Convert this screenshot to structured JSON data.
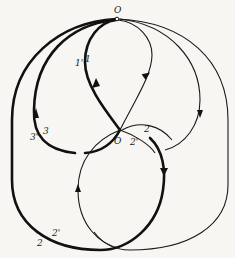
{
  "diagram": {
    "labels": {
      "O_top": "O",
      "O_center": "O",
      "l1": "1",
      "l1p": "1'",
      "l2_top": "2",
      "l2p_center": "2'",
      "l3": "3",
      "l3p": "3'",
      "l2_bottom": "2",
      "l2p_bottom": "2'"
    },
    "colors": {
      "stroke": "#1a1a1a",
      "background": "#f7f6f2"
    }
  }
}
